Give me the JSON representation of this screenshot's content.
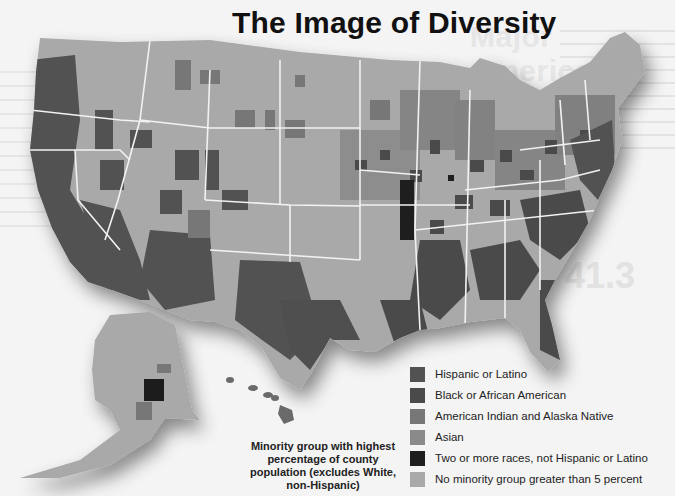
{
  "title": "The Image of Diversity",
  "background_page_fragments": {
    "heading_lines": [
      "Major",
      "American Groups",
      "the Unite"
    ],
    "number": "41.3"
  },
  "legend": {
    "caption": "Minority group with highest percentage of county population (excludes White, non-Hispanic)",
    "items": [
      {
        "label": "Hispanic or Latino",
        "color": "#525252"
      },
      {
        "label": "Black or African American",
        "color": "#4a4a4a"
      },
      {
        "label": "American Indian and Alaska Native",
        "color": "#777777"
      },
      {
        "label": "Asian",
        "color": "#8a8a8a"
      },
      {
        "label": "Two or more races, not Hispanic or Latino",
        "color": "#1e1e1e"
      },
      {
        "label": "No minority group greater than 5 percent",
        "color": "#a9a9a9"
      }
    ]
  },
  "map": {
    "regions": [
      "Contiguous United States",
      "Alaska",
      "Hawaii"
    ],
    "base_color": "#a9a9a9",
    "border_color": "#f2f2f2"
  }
}
